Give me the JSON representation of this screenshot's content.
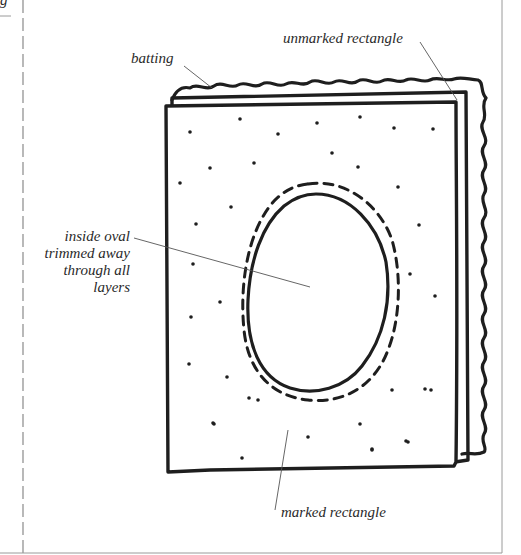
{
  "figure": {
    "partial_label_top_left": "g",
    "labels": {
      "batting": "batting",
      "unmarked_rectangle": "unmarked rectangle",
      "inside_oval": [
        "inside oval",
        "trimmed away",
        "through all",
        "layers"
      ],
      "marked_rectangle": "marked rectangle"
    },
    "colors": {
      "ink": "#1e1e1e",
      "leader_line": "#555555",
      "frame": "#9a9a9a",
      "background": "#ffffff"
    }
  }
}
